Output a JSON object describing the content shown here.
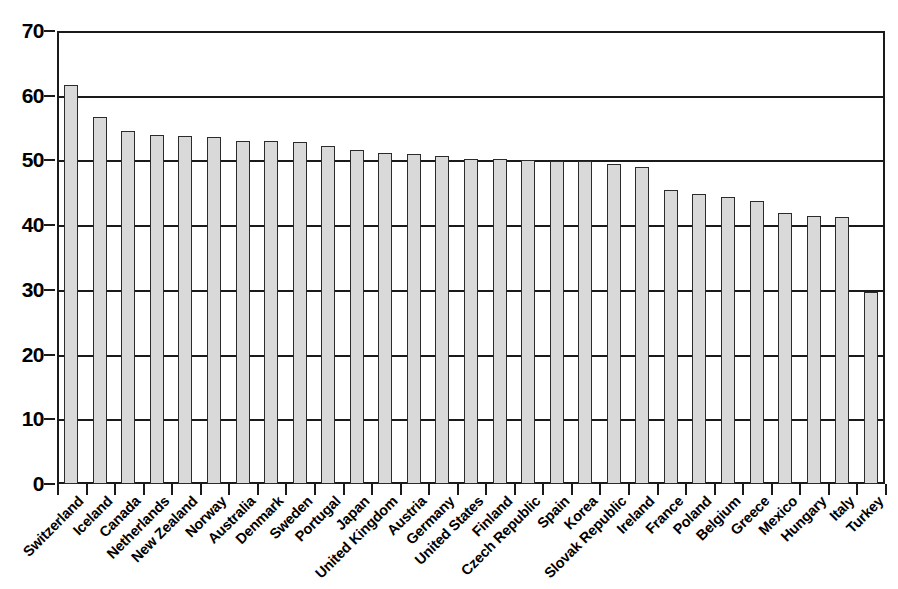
{
  "chart_data": {
    "type": "bar",
    "title": "",
    "subtitle": "",
    "xlabel": "",
    "ylabel": "",
    "ylim": [
      0,
      70
    ],
    "y_ticks": [
      0,
      10,
      20,
      30,
      40,
      50,
      60,
      70
    ],
    "grid": true,
    "legend": null,
    "bar_fill_color": "#d9d9d9",
    "bar_border_color": "#2b2b2b",
    "axis_color": "#1a1a1a",
    "categories": [
      "Switzerland",
      "Iceland",
      "Canada",
      "Netherlands",
      "New Zealand",
      "Norway",
      "Australia",
      "Denmark",
      "Sweden",
      "Portugal",
      "Japan",
      "United Kingdom",
      "Austria",
      "Germany",
      "United States",
      "Finland",
      "Czech Republic",
      "Spain",
      "Korea",
      "Slovak Republic",
      "Ireland",
      "France",
      "Poland",
      "Belgium",
      "Greece",
      "Mexico",
      "Hungary",
      "Italy",
      "Turkey"
    ],
    "values": [
      61.6,
      56.7,
      54.5,
      54.0,
      53.7,
      53.6,
      53.0,
      53.0,
      52.9,
      52.3,
      51.6,
      51.1,
      51.0,
      50.7,
      50.2,
      50.2,
      50.1,
      49.9,
      49.9,
      49.5,
      49.0,
      45.4,
      44.8,
      44.4,
      43.7,
      41.9,
      41.4,
      41.3,
      29.7
    ]
  }
}
